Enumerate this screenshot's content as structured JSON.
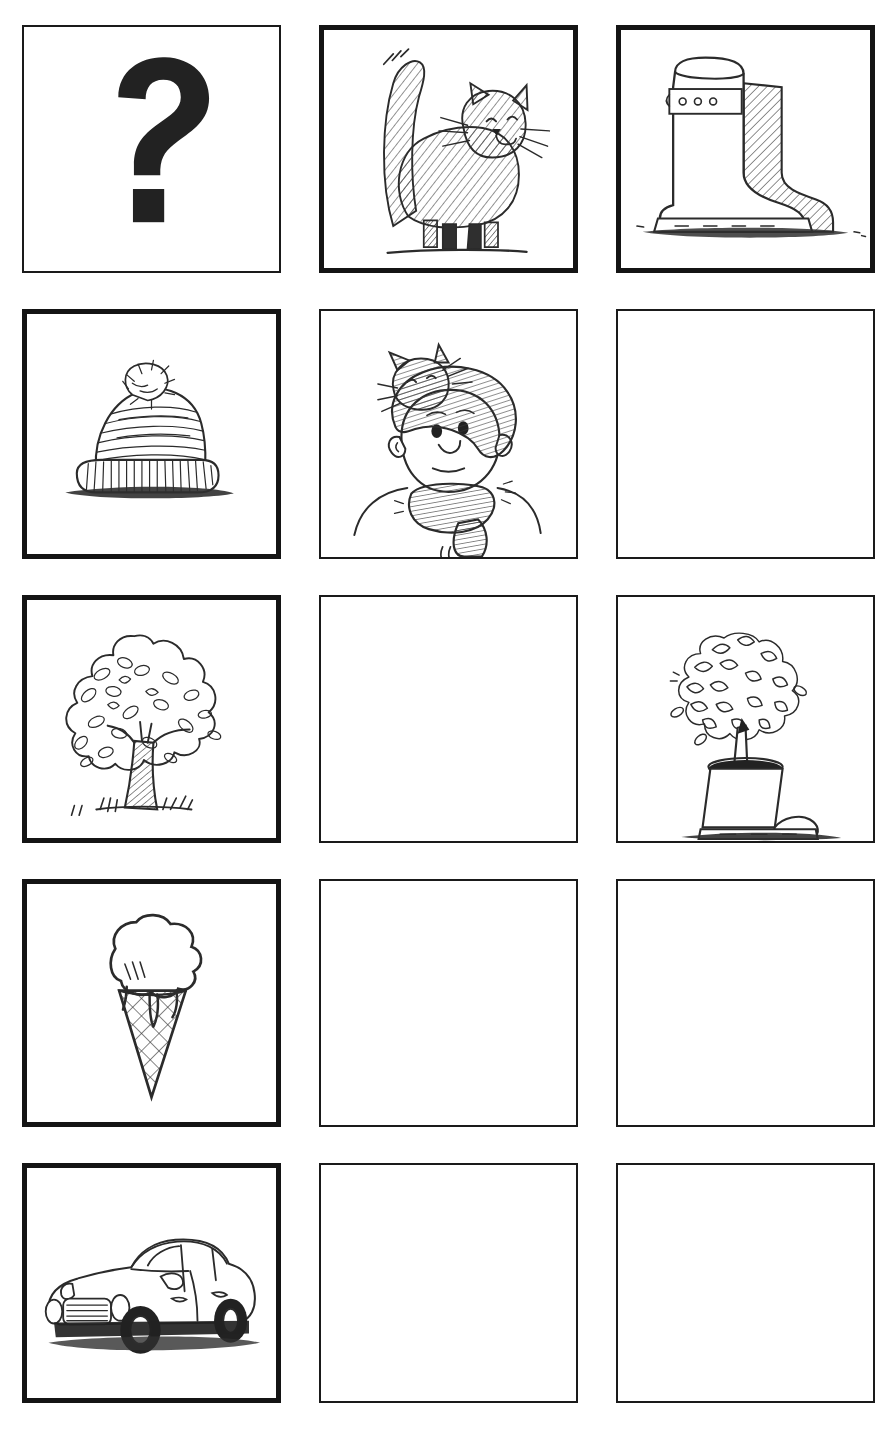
{
  "page": {
    "background_color": "#ffffff",
    "ink_color": "#2b2b2b",
    "border_color_thin": "#1a1a1a",
    "border_color_thick": "#141414"
  },
  "grid": {
    "rows": 5,
    "columns": 3,
    "cells": [
      {
        "row": 1,
        "column": 1,
        "id": "question-mark",
        "label": "Question mark",
        "content_type": "symbol",
        "symbol": "?",
        "border_weight": "thin",
        "empty": false
      },
      {
        "row": 1,
        "column": 2,
        "id": "cat",
        "label": "Cat standing with tail up",
        "content_type": "sketch",
        "border_weight": "thick",
        "empty": false
      },
      {
        "row": 1,
        "column": 3,
        "id": "rubber-boots-pair",
        "label": "Pair of rubber boots",
        "content_type": "sketch",
        "border_weight": "thick",
        "empty": false
      },
      {
        "row": 2,
        "column": 1,
        "id": "bobble-hat",
        "label": "Knitted bobble hat",
        "content_type": "sketch",
        "border_weight": "thick",
        "empty": false
      },
      {
        "row": 2,
        "column": 2,
        "id": "person-wearing-cat-hat",
        "label": "Person wearing cat as a hat with tail as scarf",
        "content_type": "sketch",
        "border_weight": "thin",
        "empty": false
      },
      {
        "row": 2,
        "column": 3,
        "id": "blank-r2c3",
        "label": "Blank panel",
        "content_type": "blank",
        "border_weight": "thin",
        "empty": true
      },
      {
        "row": 3,
        "column": 1,
        "id": "tree",
        "label": "Leafy tree",
        "content_type": "sketch",
        "border_weight": "thick",
        "empty": false
      },
      {
        "row": 3,
        "column": 2,
        "id": "blank-r3c2",
        "label": "Blank panel",
        "content_type": "blank",
        "border_weight": "thin",
        "empty": true
      },
      {
        "row": 3,
        "column": 3,
        "id": "boot-planter",
        "label": "Boot used as a plant pot with flowering tree",
        "content_type": "sketch",
        "border_weight": "thin",
        "empty": false
      },
      {
        "row": 4,
        "column": 1,
        "id": "ice-cream-cone",
        "label": "Ice cream cone",
        "content_type": "sketch",
        "border_weight": "thick",
        "empty": false
      },
      {
        "row": 4,
        "column": 2,
        "id": "blank-r4c2",
        "label": "Blank panel",
        "content_type": "blank",
        "border_weight": "thin",
        "empty": true
      },
      {
        "row": 4,
        "column": 3,
        "id": "blank-r4c3",
        "label": "Blank panel",
        "content_type": "blank",
        "border_weight": "thin",
        "empty": true
      },
      {
        "row": 5,
        "column": 1,
        "id": "car",
        "label": "Small car",
        "content_type": "sketch",
        "border_weight": "thick",
        "empty": false
      },
      {
        "row": 5,
        "column": 2,
        "id": "blank-r5c2",
        "label": "Blank panel",
        "content_type": "blank",
        "border_weight": "thin",
        "empty": true
      },
      {
        "row": 5,
        "column": 3,
        "id": "blank-r5c3",
        "label": "Blank panel",
        "content_type": "blank",
        "border_weight": "thin",
        "empty": true
      }
    ]
  }
}
